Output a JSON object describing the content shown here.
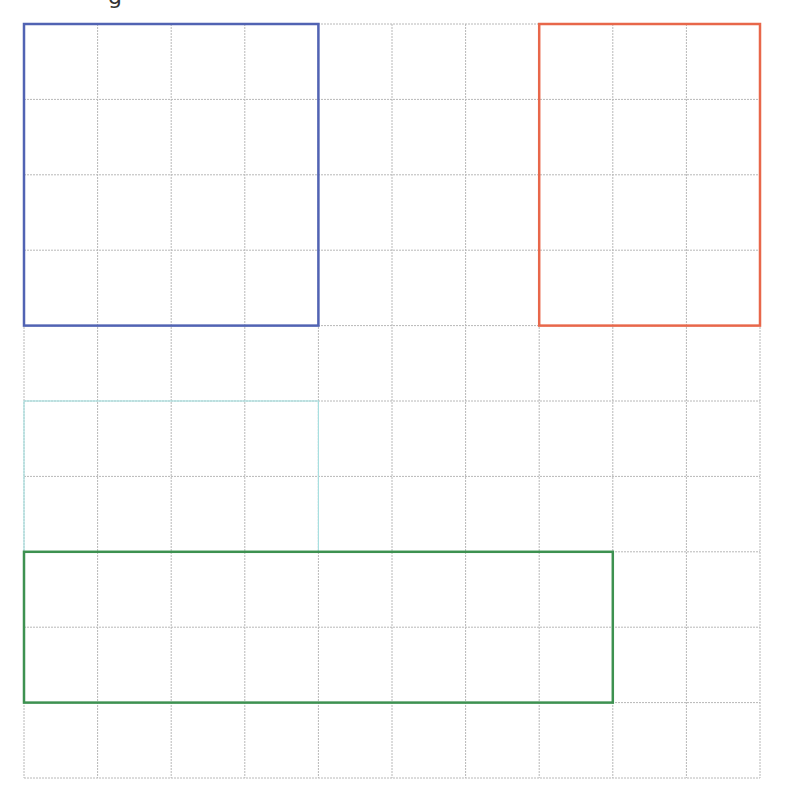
{
  "title_fragment": "g",
  "grid": {
    "origin": [
      24,
      24
    ],
    "cols": 10,
    "rows": 10,
    "cell_w": 73.6,
    "cell_h": 75.4,
    "line_color": "#b8b8b8",
    "dash": "2,1"
  },
  "rectangles": [
    {
      "name": "blue-rectangle",
      "color": "#5163b3",
      "col": 0,
      "row": 0,
      "cols": 4,
      "rows": 4,
      "stroke": 2.5
    },
    {
      "name": "orange-rectangle",
      "color": "#e8674a",
      "col": 7,
      "row": 0,
      "cols": 3,
      "rows": 4,
      "stroke": 2.5
    },
    {
      "name": "cyan-rectangle",
      "color": "#a8dfe0",
      "col": 0,
      "row": 5,
      "cols": 4,
      "rows": 2,
      "stroke": 1.2
    },
    {
      "name": "green-rectangle",
      "color": "#3d9150",
      "col": 0,
      "row": 7,
      "cols": 8,
      "rows": 2,
      "stroke": 2.5
    }
  ]
}
